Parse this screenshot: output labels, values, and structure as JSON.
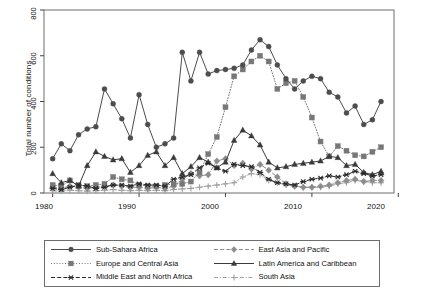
{
  "chart_data": {
    "type": "line",
    "title": "",
    "xlabel": "",
    "ylabel": "Total number of conditions",
    "xlim": [
      1979,
      2019.5
    ],
    "ylim": [
      0,
      800
    ],
    "xticks": [
      1980,
      1990,
      2000,
      2010,
      2020
    ],
    "yticks": [
      0,
      200,
      400,
      600,
      800
    ],
    "grid": false,
    "legend_position": "below-outside",
    "x": [
      1980,
      1981,
      1982,
      1983,
      1984,
      1985,
      1986,
      1987,
      1988,
      1989,
      1990,
      1991,
      1992,
      1993,
      1994,
      1995,
      1996,
      1997,
      1998,
      1999,
      2000,
      2001,
      2002,
      2003,
      2004,
      2005,
      2006,
      2007,
      2008,
      2009,
      2010,
      2011,
      2012,
      2013,
      2014,
      2015,
      2016,
      2017,
      2018
    ],
    "series": [
      {
        "name": "Sub-Sahara Africa",
        "marker": "circle",
        "linestyle": "solid",
        "color": "#4d4d4d",
        "values": [
          150,
          215,
          185,
          255,
          280,
          290,
          455,
          390,
          325,
          240,
          430,
          300,
          200,
          215,
          240,
          615,
          490,
          615,
          520,
          535,
          540,
          545,
          560,
          625,
          670,
          640,
          560,
          500,
          455,
          490,
          510,
          500,
          440,
          420,
          350,
          380,
          300,
          320,
          400
        ]
      },
      {
        "name": "Europe and Central Asia",
        "marker": "square",
        "linestyle": "dotted",
        "color": "#777777",
        "values": [
          35,
          30,
          55,
          35,
          30,
          35,
          40,
          70,
          60,
          55,
          35,
          30,
          30,
          35,
          40,
          40,
          50,
          90,
          170,
          245,
          375,
          510,
          540,
          575,
          600,
          575,
          455,
          480,
          490,
          420,
          330,
          225,
          160,
          205,
          185,
          165,
          160,
          180,
          200
        ]
      },
      {
        "name": "Middle East and North Africa",
        "marker": "star",
        "linestyle": "dashed",
        "color": "#2b2b2b",
        "values": [
          20,
          15,
          25,
          35,
          30,
          20,
          25,
          35,
          35,
          30,
          40,
          35,
          35,
          30,
          60,
          70,
          80,
          110,
          130,
          110,
          95,
          125,
          120,
          115,
          90,
          60,
          45,
          40,
          35,
          50,
          60,
          65,
          75,
          70,
          80,
          95,
          85,
          75,
          80
        ]
      },
      {
        "name": "East Asia and Pacific",
        "marker": "diamond",
        "linestyle": "dashed",
        "color": "#8c8c8c",
        "values": [
          25,
          20,
          30,
          25,
          20,
          25,
          30,
          35,
          30,
          25,
          25,
          20,
          25,
          20,
          30,
          60,
          85,
          75,
          80,
          140,
          150,
          120,
          130,
          105,
          125,
          100,
          70,
          40,
          30,
          25,
          25,
          30,
          35,
          45,
          55,
          60,
          50,
          55,
          55
        ]
      },
      {
        "name": "Latin America and Caribbean",
        "marker": "triangle",
        "linestyle": "solid",
        "color": "#3a3a3a",
        "values": [
          85,
          45,
          55,
          30,
          120,
          180,
          160,
          145,
          150,
          90,
          120,
          165,
          180,
          120,
          155,
          85,
          115,
          155,
          135,
          110,
          135,
          230,
          275,
          250,
          210,
          135,
          110,
          115,
          125,
          130,
          135,
          140,
          160,
          155,
          120,
          125,
          90,
          80,
          95
        ]
      },
      {
        "name": "South Asia",
        "marker": "plus",
        "linestyle": "dashdot",
        "color": "#a0a0a0",
        "values": [
          10,
          8,
          12,
          10,
          8,
          10,
          12,
          15,
          12,
          10,
          12,
          10,
          12,
          10,
          15,
          18,
          20,
          25,
          30,
          35,
          40,
          45,
          70,
          85,
          80,
          55,
          45,
          35,
          30,
          25,
          25,
          25,
          30,
          40,
          45,
          55,
          50,
          45,
          45
        ]
      }
    ]
  },
  "axis": {
    "y_title": "Total number of conditions",
    "ytick_labels": [
      "0",
      "200",
      "400",
      "600",
      "800"
    ],
    "xtick_labels": [
      "1980",
      "1990",
      "2000",
      "2010",
      "2020"
    ]
  },
  "legend": {
    "entries": [
      {
        "label": "Sub-Sahara Africa",
        "key": "solid-circle"
      },
      {
        "label": "East Asia and Pacific",
        "key": "dashed-diamond"
      },
      {
        "label": "Europe and Central Asia",
        "key": "dotted-square"
      },
      {
        "label": "Latin America and Caribbean",
        "key": "solid-triangle"
      },
      {
        "label": "Middle East and North Africa",
        "key": "dashed-star"
      },
      {
        "label": "South Asia",
        "key": "dashdot-plus"
      }
    ]
  }
}
